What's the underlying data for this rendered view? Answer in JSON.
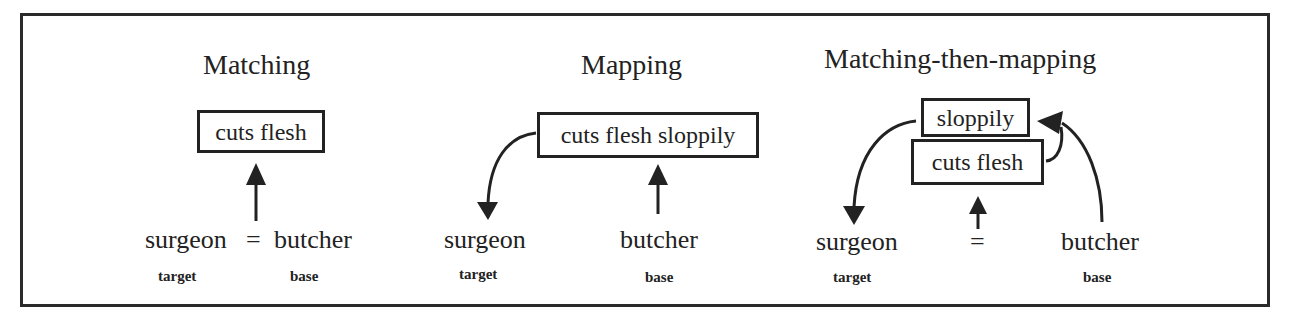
{
  "diagram": {
    "panels": [
      {
        "id": "matching",
        "title": "Matching",
        "boxes": [
          "cuts flesh"
        ],
        "target_word": "surgeon",
        "equals": "=",
        "base_word": "butcher",
        "target_label": "target",
        "base_label": "base"
      },
      {
        "id": "mapping",
        "title": "Mapping",
        "boxes": [
          "cuts flesh sloppily"
        ],
        "target_word": "surgeon",
        "base_word": "butcher",
        "target_label": "target",
        "base_label": "base"
      },
      {
        "id": "matching-then-mapping",
        "title": "Matching-then-mapping",
        "boxes": [
          "sloppily",
          "cuts flesh"
        ],
        "target_word": "surgeon",
        "equals": "=",
        "base_word": "butcher",
        "target_label": "target",
        "base_label": "base"
      }
    ],
    "colors": {
      "ink": "#222222",
      "background": "#ffffff"
    }
  }
}
